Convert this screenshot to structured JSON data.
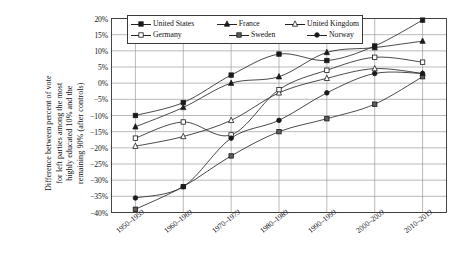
{
  "chart_data": {
    "type": "line",
    "title": "",
    "xlabel": "",
    "ylabel": "Difference between percent of vote for left parties among the most highly educated 10% and the remaining 90% (after controls)",
    "ylabel_lines": [
      "Difference between percent of vote",
      "for left parties among the most",
      "highly educated 10% and the",
      "remaining 90% (after controls)"
    ],
    "categories": [
      "1950–1959",
      "1960–1969",
      "1970–1979",
      "1980–1989",
      "1990–1999",
      "2000–2009",
      "2010–2019"
    ],
    "ylim": [
      -40,
      20
    ],
    "ytick_values": [
      20,
      15,
      10,
      5,
      0,
      -5,
      -10,
      -15,
      -20,
      -25,
      -30,
      -35,
      -40
    ],
    "ytick_labels": [
      "20%",
      "15%",
      "10%",
      "5%",
      "0%",
      "−5%",
      "−10%",
      "−15%",
      "−20%",
      "−25%",
      "−30%",
      "−35%",
      "−40%"
    ],
    "grid": true,
    "legend_position": "top-center",
    "series": [
      {
        "name": "United States",
        "marker": "filled-square",
        "color": "#1a1a1a",
        "values": [
          -10.0,
          -6.0,
          2.5,
          9.0,
          7.0,
          11.5,
          19.5
        ]
      },
      {
        "name": "France",
        "marker": "filled-triangle",
        "color": "#1a1a1a",
        "values": [
          -13.5,
          -7.5,
          0.0,
          2.0,
          9.5,
          11.0,
          13.0
        ]
      },
      {
        "name": "United Kingdom",
        "marker": "open-triangle",
        "color": "#1a1a1a",
        "values": [
          -19.5,
          -16.5,
          -11.5,
          -3.0,
          1.5,
          4.5,
          3.0
        ]
      },
      {
        "name": "Germany",
        "marker": "open-square",
        "color": "#1a1a1a",
        "values": [
          -17.0,
          -12.0,
          -16.0,
          -2.0,
          4.0,
          8.0,
          6.5
        ]
      },
      {
        "name": "Sweden",
        "marker": "filled-square-gray",
        "color": "#595959",
        "values": [
          -39.0,
          -32.0,
          -22.5,
          -15.0,
          -11.0,
          -6.5,
          2.0
        ]
      },
      {
        "name": "Norway",
        "marker": "filled-circle",
        "color": "#1a1a1a",
        "values": [
          -35.5,
          -32.0,
          -17.0,
          -11.5,
          -3.0,
          3.0,
          3.0
        ]
      }
    ]
  },
  "legend": {
    "rows": [
      [
        "United States",
        "France",
        "United Kingdom"
      ],
      [
        "Germany",
        "Sweden",
        "Norway"
      ]
    ]
  }
}
